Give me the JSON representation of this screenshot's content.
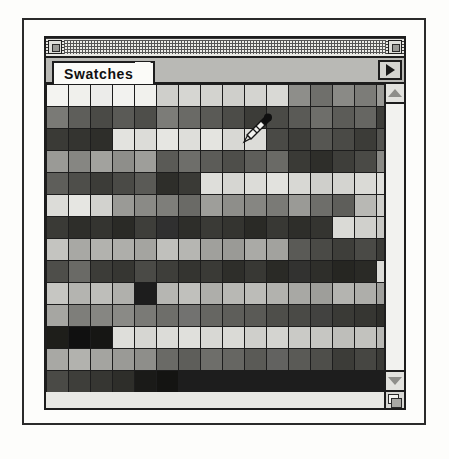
{
  "window": {
    "title_bar": {
      "close_box_name": "close-box",
      "zoom_box_name": "zoom-box"
    },
    "tab": {
      "label": "Swatches"
    },
    "palette_menu": {
      "icon": "triangle-right-icon"
    },
    "scrollbar": {
      "up_icon": "triangle-up-icon",
      "down_icon": "triangle-down-icon",
      "grow_box_icon": "resize-grow-box-icon"
    },
    "cursor": {
      "icon": "eyedropper-cursor-icon",
      "x": 240,
      "y": 112
    }
  },
  "colors": {
    "window_chrome": "#c9c9c5",
    "outline": "#1d1d1d",
    "tab_active_bg": "#fbfbf8",
    "swatch_area_bg": "#e8e8e4",
    "scrollbar_track": "#f2f2ef"
  },
  "swatches": {
    "columns": 16,
    "rows": 14,
    "cell_size": 21,
    "grid": [
      [
        "#f4f4f1",
        "#f0f0ec",
        "#ececeA",
        "#f2f2ef",
        "#f1f1ed",
        "#cfcfcb",
        "#d6d6d2",
        "#d3d3cf",
        "#cfcfcb",
        "#d4d4d0",
        "#d9d9d5",
        "#8e8e8a",
        "#6f6f6b",
        "#8a8a86",
        "#7c7c78",
        "#9a9a96"
      ],
      [
        "#7a7a76",
        "#5e5e5a",
        "#4a4a46",
        "#5a5a56",
        "#4e4e4a",
        "#7c7c78",
        "#6a6a66",
        "#5a5a56",
        "#4c4c48",
        "#3c3c38",
        "#4a4a46",
        "#5a5a56",
        "#6e6e6a",
        "#5c5c58",
        "#666662",
        "#3e3e3a"
      ],
      [
        "#3a3a36",
        "#343430",
        "#2e2e2a",
        "#e3e3df",
        "#dcdcd8",
        "#e6e6e2",
        "#dededa",
        "#e4e4e0",
        "#d8d8d4",
        "#dcdcd8",
        "#4a4a46",
        "#3e3e3a",
        "#565652",
        "#4a4a46",
        "#3c3c38",
        "#545450"
      ],
      [
        "#9a9a96",
        "#868682",
        "#a2a29e",
        "#8e8e8a",
        "#9e9e9a",
        "#5a5a56",
        "#6e6e6a",
        "#5c5c58",
        "#4e4e4a",
        "#5e5e5a",
        "#6a6a66",
        "#3a3a36",
        "#2e2e2a",
        "#3e3e3a",
        "#4a4a46",
        "#8a8a86"
      ],
      [
        "#5e5e5a",
        "#4e4e4a",
        "#3c3c38",
        "#4a4a46",
        "#5a5a56",
        "#2e2e2a",
        "#3a3a36",
        "#dededa",
        "#d6d6d2",
        "#dcdcd8",
        "#e2e2de",
        "#d8d8d4",
        "#cfcfcb",
        "#d4d4d0",
        "#dadad6",
        "#e0e0dc"
      ],
      [
        "#dcdcd8",
        "#e6e6e2",
        "#d2d2ce",
        "#9a9a96",
        "#8a8a86",
        "#7e7e7a",
        "#6a6a66",
        "#9e9e9a",
        "#8e8e8a",
        "#868682",
        "#7a7a76",
        "#9a9a96",
        "#6e6e6a",
        "#5e5e5a",
        "#b8b8b4",
        "#cfcfcb"
      ],
      [
        "#3a3a36",
        "#2e2e2a",
        "#343430",
        "#2a2a26",
        "#3e3e3a",
        "#303030",
        "#2e2e2a",
        "#3a3a36",
        "#343430",
        "#2a2a26",
        "#383834",
        "#2e2e2a",
        "#343430",
        "#dadad6",
        "#d0d0cc",
        "#c8c8c4"
      ],
      [
        "#c4c4c0",
        "#a8a8a4",
        "#b2b2ae",
        "#aeaeaa",
        "#a4a4a0",
        "#c0c0bc",
        "#b6b6b2",
        "#a0a09c",
        "#9a9a96",
        "#aaaaa6",
        "#a2a29e",
        "#5a5a56",
        "#4a4a46",
        "#3e3e3a",
        "#4a4a46",
        "#3a3a36"
      ],
      [
        "#4e4e4a",
        "#6a6a66",
        "#3c3c38",
        "#363632",
        "#4a4a46",
        "#3e3e3a",
        "#343430",
        "#3a3a36",
        "#2e2e2a",
        "#383834",
        "#2a2a26",
        "#323230",
        "#2e2e2a",
        "#262622",
        "#2a2a26",
        "#dcdcd8"
      ],
      [
        "#c6c6c2",
        "#b4b4b0",
        "#bebeba",
        "#b0b0ac",
        "#bababb6",
        "#b6b6b2",
        "#c0c0bc",
        "#aeaeaa",
        "#b8b8b4",
        "#bcbcb8",
        "#b2b2ae",
        "#a8a8a4",
        "#9e9e9a",
        "#b4b4b0",
        "#aeaeaa",
        "#a0a09c"
      ],
      [
        "#a6a6a2",
        "#7e7e7a",
        "#868682",
        "#8a8a86",
        "#7a7a76",
        "#6e6e6a",
        "#727270",
        "#666662",
        "#5e5e5a",
        "#5a5a56",
        "#4e4e4a",
        "#4a4a46",
        "#424240",
        "#3a3a36",
        "#363632",
        "#2e2e2a"
      ],
      [
        "#1e1e1a",
        "#101010",
        "#161614",
        "#dededa",
        "#d6d6d2",
        "#dcdcd8",
        "#e0e0dc",
        "#d8d8d4",
        "#dadad6",
        "#cfcfcb",
        "#d4d4d0",
        "#cacac6",
        "#c6c6c2",
        "#bebeba",
        "#c2c2be",
        "#b8b8b4"
      ],
      [
        "#a8a8a4",
        "#b2b2ae",
        "#a4a4a0",
        "#9a9a96",
        "#8e8e8a",
        "#6a6a66",
        "#5e5e5a",
        "#6e6e6a",
        "#666662",
        "#5a5a56",
        "#626260",
        "#5a5a56",
        "#4e4e4a",
        "#3c3c38",
        "#464642",
        "#3a3a36"
      ],
      [
        "#4a4a46",
        "#3e3e3a",
        "#363632",
        "#2e2e2a",
        "#1a1a18",
        "#141412"
      ]
    ]
  }
}
